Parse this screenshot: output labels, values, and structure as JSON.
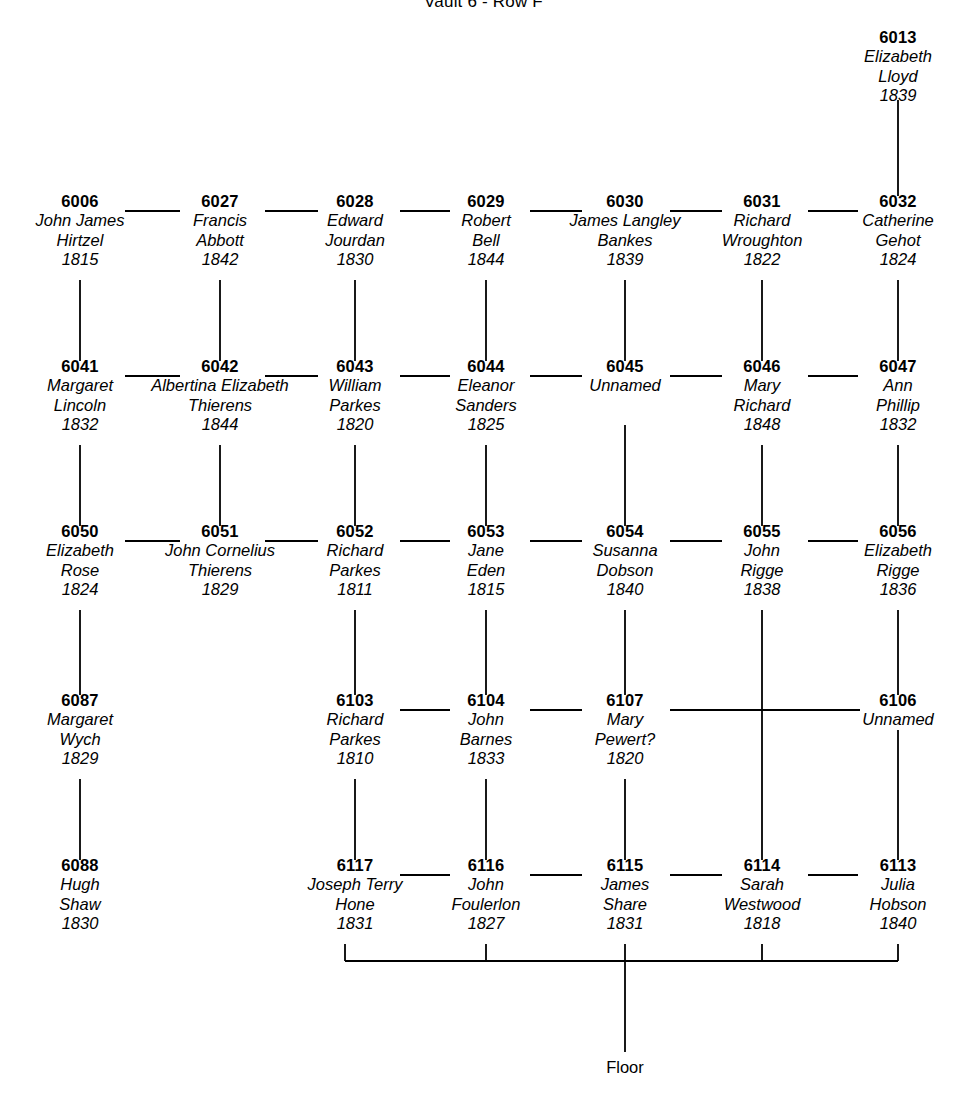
{
  "title": "Vault 6 - Row F",
  "floor_label": "Floor",
  "colors": {
    "line": "#000000",
    "text": "#000000",
    "background": "#ffffff"
  },
  "columns": [
    {
      "index": 1,
      "x": 80
    },
    {
      "index": 2,
      "x": 220
    },
    {
      "index": 3,
      "x": 355
    },
    {
      "index": 4,
      "x": 486
    },
    {
      "index": 5,
      "x": 625
    },
    {
      "index": 6,
      "x": 762
    },
    {
      "index": 7,
      "x": 898
    }
  ],
  "rows": [
    {
      "index": 0,
      "y": 40
    },
    {
      "index": 1,
      "y": 204
    },
    {
      "index": 2,
      "y": 369
    },
    {
      "index": 3,
      "y": 534
    },
    {
      "index": 4,
      "y": 703
    },
    {
      "index": 5,
      "y": 868
    }
  ],
  "nodes": [
    {
      "id": "6013",
      "name_lines": [
        "Elizabeth",
        "Lloyd"
      ],
      "year": "1839",
      "col": 7,
      "row": 0,
      "x": 898,
      "y": 40
    },
    {
      "id": "6006",
      "name_lines": [
        "John James",
        "Hirtzel"
      ],
      "year": "1815",
      "col": 1,
      "row": 1,
      "x": 80,
      "y": 204
    },
    {
      "id": "6027",
      "name_lines": [
        "Francis",
        "Abbott"
      ],
      "year": "1842",
      "col": 2,
      "row": 1,
      "x": 220,
      "y": 204
    },
    {
      "id": "6028",
      "name_lines": [
        "Edward",
        "Jourdan"
      ],
      "year": "1830",
      "col": 3,
      "row": 1,
      "x": 355,
      "y": 204
    },
    {
      "id": "6029",
      "name_lines": [
        "Robert",
        "Bell"
      ],
      "year": "1844",
      "col": 4,
      "row": 1,
      "x": 486,
      "y": 204
    },
    {
      "id": "6030",
      "name_lines": [
        "James Langley",
        "Bankes"
      ],
      "year": "1839",
      "col": 5,
      "row": 1,
      "x": 625,
      "y": 204
    },
    {
      "id": "6031",
      "name_lines": [
        "Richard",
        "Wroughton"
      ],
      "year": "1822",
      "col": 6,
      "row": 1,
      "x": 762,
      "y": 204
    },
    {
      "id": "6032",
      "name_lines": [
        "Catherine",
        "Gehot"
      ],
      "year": "1824",
      "col": 7,
      "row": 1,
      "x": 898,
      "y": 204
    },
    {
      "id": "6041",
      "name_lines": [
        "Margaret",
        "Lincoln"
      ],
      "year": "1832",
      "col": 1,
      "row": 2,
      "x": 80,
      "y": 369
    },
    {
      "id": "6042",
      "name_lines": [
        "Albertina Elizabeth",
        "Thierens"
      ],
      "year": "1844",
      "col": 2,
      "row": 2,
      "x": 220,
      "y": 369
    },
    {
      "id": "6043",
      "name_lines": [
        "William",
        "Parkes"
      ],
      "year": "1820",
      "col": 3,
      "row": 2,
      "x": 355,
      "y": 369
    },
    {
      "id": "6044",
      "name_lines": [
        "Eleanor",
        "Sanders"
      ],
      "year": "1825",
      "col": 4,
      "row": 2,
      "x": 486,
      "y": 369
    },
    {
      "id": "6045",
      "name_lines": [
        "Unnamed"
      ],
      "year": "",
      "col": 5,
      "row": 2,
      "x": 625,
      "y": 369
    },
    {
      "id": "6046",
      "name_lines": [
        "Mary",
        "Richard"
      ],
      "year": "1848",
      "col": 6,
      "row": 2,
      "x": 762,
      "y": 369
    },
    {
      "id": "6047",
      "name_lines": [
        "Ann",
        "Phillip"
      ],
      "year": "1832",
      "col": 7,
      "row": 2,
      "x": 898,
      "y": 369
    },
    {
      "id": "6050",
      "name_lines": [
        "Elizabeth",
        "Rose"
      ],
      "year": "1824",
      "col": 1,
      "row": 3,
      "x": 80,
      "y": 534
    },
    {
      "id": "6051",
      "name_lines": [
        "John Cornelius",
        "Thierens"
      ],
      "year": "1829",
      "col": 2,
      "row": 3,
      "x": 220,
      "y": 534
    },
    {
      "id": "6052",
      "name_lines": [
        "Richard",
        "Parkes"
      ],
      "year": "1811",
      "col": 3,
      "row": 3,
      "x": 355,
      "y": 534
    },
    {
      "id": "6053",
      "name_lines": [
        "Jane",
        "Eden"
      ],
      "year": "1815",
      "col": 4,
      "row": 3,
      "x": 486,
      "y": 534
    },
    {
      "id": "6054",
      "name_lines": [
        "Susanna",
        "Dobson"
      ],
      "year": "1840",
      "col": 5,
      "row": 3,
      "x": 625,
      "y": 534
    },
    {
      "id": "6055",
      "name_lines": [
        "John",
        "Rigge"
      ],
      "year": "1838",
      "col": 6,
      "row": 3,
      "x": 762,
      "y": 534
    },
    {
      "id": "6056",
      "name_lines": [
        "Elizabeth",
        "Rigge"
      ],
      "year": "1836",
      "col": 7,
      "row": 3,
      "x": 898,
      "y": 534
    },
    {
      "id": "6087",
      "name_lines": [
        "Margaret",
        "Wych"
      ],
      "year": "1829",
      "col": 1,
      "row": 4,
      "x": 80,
      "y": 703
    },
    {
      "id": "6103",
      "name_lines": [
        "Richard",
        "Parkes"
      ],
      "year": "1810",
      "col": 3,
      "row": 4,
      "x": 355,
      "y": 703
    },
    {
      "id": "6104",
      "name_lines": [
        "John",
        "Barnes"
      ],
      "year": "1833",
      "col": 4,
      "row": 4,
      "x": 486,
      "y": 703
    },
    {
      "id": "6107",
      "name_lines": [
        "Mary",
        "Pewert?"
      ],
      "year": "1820",
      "col": 5,
      "row": 4,
      "x": 625,
      "y": 703
    },
    {
      "id": "6106",
      "name_lines": [
        "Unnamed"
      ],
      "year": "",
      "col": 7,
      "row": 4,
      "x": 898,
      "y": 703
    },
    {
      "id": "6088",
      "name_lines": [
        "Hugh",
        "Shaw"
      ],
      "year": "1830",
      "col": 1,
      "row": 5,
      "x": 80,
      "y": 868
    },
    {
      "id": "6117",
      "name_lines": [
        "Joseph Terry",
        "Hone"
      ],
      "year": "1831",
      "col": 3,
      "row": 5,
      "x": 355,
      "y": 868
    },
    {
      "id": "6116",
      "name_lines": [
        "John",
        "Foulerlon"
      ],
      "year": "1827",
      "col": 4,
      "row": 5,
      "x": 486,
      "y": 868
    },
    {
      "id": "6115",
      "name_lines": [
        "James",
        "Share"
      ],
      "year": "1831",
      "col": 5,
      "row": 5,
      "x": 625,
      "y": 868
    },
    {
      "id": "6114",
      "name_lines": [
        "Sarah",
        "Westwood"
      ],
      "year": "1818",
      "col": 6,
      "row": 5,
      "x": 762,
      "y": 868
    },
    {
      "id": "6113",
      "name_lines": [
        "Julia",
        "Hobson"
      ],
      "year": "1840",
      "col": 7,
      "row": 5,
      "x": 898,
      "y": 868
    }
  ],
  "horizontal_links": [
    {
      "from": "6006",
      "to": "6027",
      "x1": 125,
      "x2": 180,
      "y": 211
    },
    {
      "from": "6027",
      "to": "6028",
      "x1": 265,
      "x2": 318,
      "y": 211
    },
    {
      "from": "6028",
      "to": "6029",
      "x1": 400,
      "x2": 450,
      "y": 211
    },
    {
      "from": "6029",
      "to": "6030",
      "x1": 530,
      "x2": 582,
      "y": 211
    },
    {
      "from": "6030",
      "to": "6031",
      "x1": 670,
      "x2": 722,
      "y": 211
    },
    {
      "from": "6031",
      "to": "6032",
      "x1": 808,
      "x2": 858,
      "y": 211
    },
    {
      "from": "6041",
      "to": "6042",
      "x1": 125,
      "x2": 180,
      "y": 376
    },
    {
      "from": "6042",
      "to": "6043",
      "x1": 265,
      "x2": 318,
      "y": 376
    },
    {
      "from": "6043",
      "to": "6044",
      "x1": 400,
      "x2": 450,
      "y": 376
    },
    {
      "from": "6044",
      "to": "6045",
      "x1": 530,
      "x2": 582,
      "y": 376
    },
    {
      "from": "6045",
      "to": "6046",
      "x1": 670,
      "x2": 722,
      "y": 376
    },
    {
      "from": "6046",
      "to": "6047",
      "x1": 808,
      "x2": 858,
      "y": 376
    },
    {
      "from": "6050",
      "to": "6051",
      "x1": 125,
      "x2": 180,
      "y": 541
    },
    {
      "from": "6051",
      "to": "6052",
      "x1": 265,
      "x2": 318,
      "y": 541
    },
    {
      "from": "6052",
      "to": "6053",
      "x1": 400,
      "x2": 450,
      "y": 541
    },
    {
      "from": "6053",
      "to": "6054",
      "x1": 530,
      "x2": 582,
      "y": 541
    },
    {
      "from": "6054",
      "to": "6055",
      "x1": 670,
      "x2": 722,
      "y": 541
    },
    {
      "from": "6055",
      "to": "6056",
      "x1": 808,
      "x2": 858,
      "y": 541
    },
    {
      "from": "6103",
      "to": "6104",
      "x1": 400,
      "x2": 450,
      "y": 710
    },
    {
      "from": "6104",
      "to": "6107",
      "x1": 530,
      "x2": 582,
      "y": 710
    },
    {
      "from": "6107",
      "to": "6106",
      "x1": 670,
      "x2": 860,
      "y": 710
    },
    {
      "from": "6117",
      "to": "6116",
      "x1": 400,
      "x2": 450,
      "y": 875
    },
    {
      "from": "6116",
      "to": "6115",
      "x1": 530,
      "x2": 582,
      "y": 875
    },
    {
      "from": "6115",
      "to": "6114",
      "x1": 670,
      "x2": 722,
      "y": 875
    },
    {
      "from": "6114",
      "to": "6113",
      "x1": 808,
      "x2": 858,
      "y": 875
    }
  ],
  "vertical_links": [
    {
      "from": "6013",
      "to": "6032",
      "x": 898,
      "y1": 100,
      "y2": 196
    },
    {
      "from": "6006",
      "to": "6041",
      "x": 80,
      "y1": 280,
      "y2": 361
    },
    {
      "from": "6027",
      "to": "6042",
      "x": 220,
      "y1": 280,
      "y2": 361
    },
    {
      "from": "6028",
      "to": "6043",
      "x": 355,
      "y1": 280,
      "y2": 361
    },
    {
      "from": "6029",
      "to": "6044",
      "x": 486,
      "y1": 280,
      "y2": 361
    },
    {
      "from": "6030",
      "to": "6045",
      "x": 625,
      "y1": 280,
      "y2": 361
    },
    {
      "from": "6031",
      "to": "6046",
      "x": 762,
      "y1": 280,
      "y2": 361
    },
    {
      "from": "6032",
      "to": "6047",
      "x": 898,
      "y1": 280,
      "y2": 361
    },
    {
      "from": "6041",
      "to": "6050",
      "x": 80,
      "y1": 445,
      "y2": 526
    },
    {
      "from": "6042",
      "to": "6051",
      "x": 220,
      "y1": 445,
      "y2": 526
    },
    {
      "from": "6043",
      "to": "6052",
      "x": 355,
      "y1": 445,
      "y2": 526
    },
    {
      "from": "6044",
      "to": "6053",
      "x": 486,
      "y1": 445,
      "y2": 526
    },
    {
      "from": "6045",
      "to": "6054",
      "x": 625,
      "y1": 425,
      "y2": 526
    },
    {
      "from": "6046",
      "to": "6055",
      "x": 762,
      "y1": 445,
      "y2": 526
    },
    {
      "from": "6047",
      "to": "6056",
      "x": 898,
      "y1": 445,
      "y2": 526
    },
    {
      "from": "6050",
      "to": "6087",
      "x": 80,
      "y1": 610,
      "y2": 695
    },
    {
      "from": "6052",
      "to": "6103",
      "x": 355,
      "y1": 610,
      "y2": 695
    },
    {
      "from": "6053",
      "to": "6104",
      "x": 486,
      "y1": 610,
      "y2": 695
    },
    {
      "from": "6054",
      "to": "6107",
      "x": 625,
      "y1": 610,
      "y2": 695
    },
    {
      "from": "6055",
      "to": "6114",
      "x": 762,
      "y1": 610,
      "y2": 860
    },
    {
      "from": "6056",
      "to": "6106",
      "x": 898,
      "y1": 610,
      "y2": 695
    },
    {
      "from": "6087",
      "to": "6088",
      "x": 80,
      "y1": 779,
      "y2": 860
    },
    {
      "from": "6103",
      "to": "6117",
      "x": 355,
      "y1": 779,
      "y2": 860
    },
    {
      "from": "6104",
      "to": "6116",
      "x": 486,
      "y1": 779,
      "y2": 860
    },
    {
      "from": "6107",
      "to": "6115",
      "x": 625,
      "y1": 779,
      "y2": 860
    },
    {
      "from": "6106",
      "to": "6113",
      "x": 898,
      "y1": 730,
      "y2": 860
    }
  ],
  "floor_bus": {
    "y": 961,
    "x_left": 345,
    "x_right": 898,
    "stub_top": 944,
    "drop_x": 625,
    "drop_bottom": 1052,
    "stub_columns": [
      345,
      486,
      625,
      762,
      898
    ],
    "label_y": 1058
  }
}
